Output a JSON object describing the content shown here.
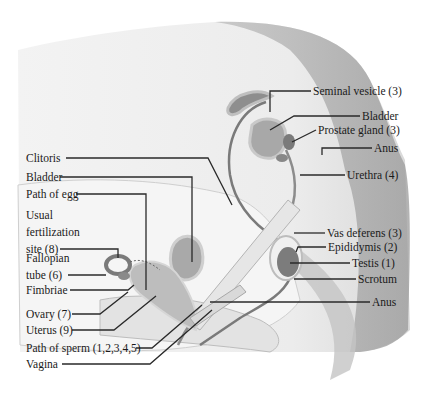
{
  "diagram": {
    "title": "",
    "labels_left": [
      {
        "id": "clitoris",
        "text": "Clitoris"
      },
      {
        "id": "bladder-f",
        "text": "Bladder"
      },
      {
        "id": "path-egg",
        "text": "Path of egg"
      },
      {
        "id": "fert-1",
        "text": "Usual"
      },
      {
        "id": "fert-2",
        "text": "fertilization"
      },
      {
        "id": "fert-3",
        "text": "site (8)"
      },
      {
        "id": "fallopian-1",
        "text": "Fallopian"
      },
      {
        "id": "fallopian-2",
        "text": "tube (6)"
      },
      {
        "id": "fimbriae",
        "text": "Fimbriae"
      },
      {
        "id": "ovary",
        "text": "Ovary (7)"
      },
      {
        "id": "uterus",
        "text": "Uterus (9)"
      },
      {
        "id": "path-sperm",
        "text": "Path of sperm (1,2,3,4,5)"
      },
      {
        "id": "vagina",
        "text": "Vagina"
      }
    ],
    "labels_right": [
      {
        "id": "seminal",
        "text": "Seminal vesicle (3)"
      },
      {
        "id": "bladder-m",
        "text": "Bladder"
      },
      {
        "id": "prostate",
        "text": "Prostate gland (3)"
      },
      {
        "id": "anus-m",
        "text": "Anus"
      },
      {
        "id": "urethra",
        "text": "Urethra (4)"
      },
      {
        "id": "vas",
        "text": "Vas deferens (3)"
      },
      {
        "id": "epididymis",
        "text": "Epididymis (2)"
      },
      {
        "id": "testis",
        "text": "Testis (1)"
      },
      {
        "id": "scrotum",
        "text": "Scrotum"
      },
      {
        "id": "anus-f",
        "text": "Anus"
      }
    ]
  }
}
